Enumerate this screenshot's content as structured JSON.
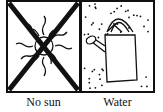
{
  "panels": [
    {
      "id": "no-sun",
      "icon": "sun-icon",
      "crossed_out": true,
      "caption": "No sun"
    },
    {
      "id": "water",
      "icon": "watering-can-icon",
      "crossed_out": false,
      "caption": "Water"
    }
  ],
  "colors": {
    "ink": "#111111",
    "background": "#ffffff"
  }
}
